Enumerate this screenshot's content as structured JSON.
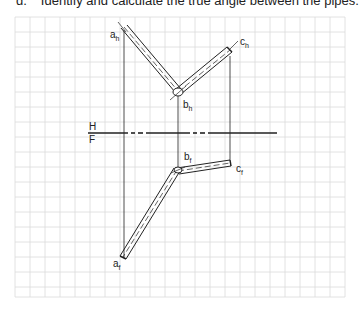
{
  "question": {
    "number": "d.",
    "text": "Identify and calculate the true angle between the pipes."
  },
  "labels": {
    "a_h": "a",
    "a_h_sub": "h",
    "b_h": "b",
    "b_h_sub": "h",
    "c_h": "c",
    "c_h_sub": "h",
    "b_f": "b",
    "b_f_sub": "f",
    "c_f": "c",
    "c_f_sub": "f",
    "a_f": "a",
    "a_f_sub": "f",
    "fold_top": "H",
    "fold_bottom": "F"
  },
  "colors": {
    "grid": "#d9d9d9",
    "line": "#222222"
  }
}
